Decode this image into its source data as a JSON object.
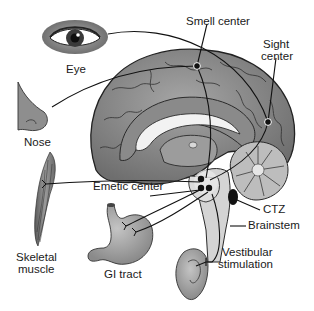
{
  "diagram": {
    "labels": {
      "eye": "Eye",
      "smell_center": "Smell center",
      "sight_center_line1": "Sight",
      "sight_center_line2": "center",
      "nose": "Nose",
      "emetic_center": "Emetic center",
      "ctz": "CTZ",
      "brainstem": "Brainstem",
      "skeletal_muscle_line1": "Skeletal",
      "skeletal_muscle_line2": "muscle",
      "gi_tract": "GI tract",
      "vestibular_line1": "Vestibular",
      "vestibular_line2": "stimulation"
    },
    "colors": {
      "brain_outer": "#7a7a7a",
      "brain_inner": "#9a9a9a",
      "corpus_callosum": "#f0f0f0",
      "brainstem": "#d0d0d0",
      "outline": "#222222",
      "organ_fill": "#a8a8a8",
      "text": "#1a1a1a"
    }
  }
}
